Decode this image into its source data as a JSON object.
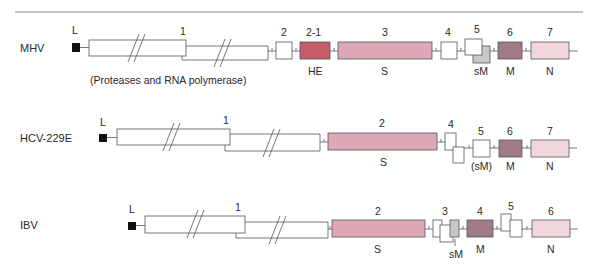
{
  "colors": {
    "rule": "#8a8a8a",
    "outline": "#555555",
    "leader": "#111111",
    "white": "#ffffff",
    "HE": "#c45c6a",
    "S": "#dba8b3",
    "sM": "#c8c8c8",
    "M": "#a07a84",
    "N": "#f1d7dc"
  },
  "rows": [
    {
      "label": "MHV",
      "leader_label": "L",
      "gene1_label": "1",
      "gene1_note": "(Proteases and RNA polymerase)",
      "genes": [
        {
          "num": "2",
          "protein": ""
        },
        {
          "num": "2-1",
          "protein": "HE"
        },
        {
          "num": "3",
          "protein": "S"
        },
        {
          "num": "4",
          "protein": ""
        },
        {
          "num": "5",
          "protein": "sM"
        },
        {
          "num": "6",
          "protein": "M"
        },
        {
          "num": "7",
          "protein": "N"
        }
      ]
    },
    {
      "label": "HCV-229E",
      "leader_label": "L",
      "gene1_label": "1",
      "genes": [
        {
          "num": "2",
          "protein": "S"
        },
        {
          "num": "4",
          "protein": ""
        },
        {
          "num": "5",
          "protein": "(sM)"
        },
        {
          "num": "6",
          "protein": "M"
        },
        {
          "num": "7",
          "protein": "N"
        }
      ]
    },
    {
      "label": "IBV",
      "leader_label": "L",
      "gene1_label": "1",
      "genes": [
        {
          "num": "2",
          "protein": "S"
        },
        {
          "num": "3",
          "protein": "sM"
        },
        {
          "num": "4",
          "protein": "M"
        },
        {
          "num": "5",
          "protein": ""
        },
        {
          "num": "6",
          "protein": "N"
        }
      ]
    }
  ]
}
